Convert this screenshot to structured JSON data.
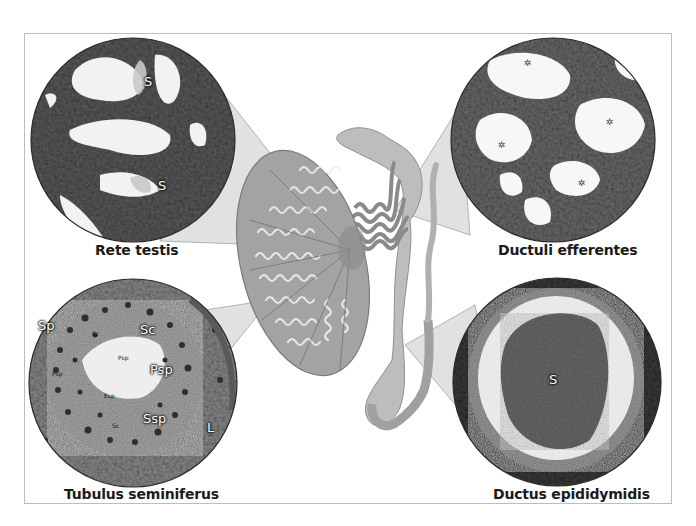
{
  "figure": {
    "colors": {
      "frame_border": "#bdbdbd",
      "testis_fill": "#9a9a9a",
      "duct_fill": "#b8b8b8",
      "zoom_cone": "#c8c8c8",
      "histology_dark": "#4a4a4a",
      "lumen": "#f4f4f4"
    }
  },
  "insets": [
    {
      "id": "rete-testis",
      "caption": "Rete testis",
      "markers": [
        "S",
        "S"
      ]
    },
    {
      "id": "ductuli-efferentes",
      "caption": "Ductuli efferentes",
      "markers": [
        "✲",
        "✲",
        "✲",
        "✲"
      ]
    },
    {
      "id": "tubulus-seminiferus",
      "caption": "Tubulus seminiferus",
      "markers": [
        "Sp",
        "Sc",
        "Psp",
        "Ssp",
        "L"
      ],
      "small_markers": [
        "Psp",
        "Psp",
        "Esp",
        "Sc",
        "Sc"
      ]
    },
    {
      "id": "ductus-epididymidis",
      "caption": "Ductus epididymidis",
      "markers": [
        "S"
      ]
    }
  ]
}
